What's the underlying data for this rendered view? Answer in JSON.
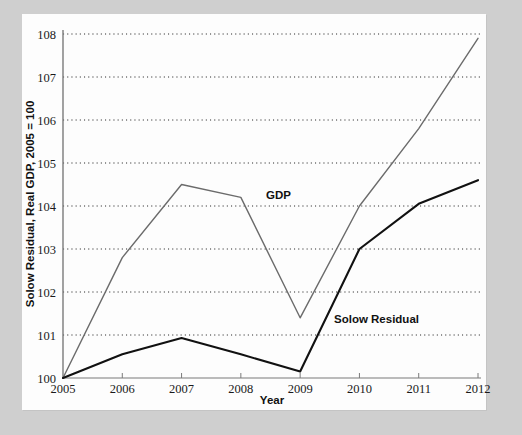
{
  "figure": {
    "background_color": "#cfcfcf",
    "panel_color": "#fdfdfd"
  },
  "chart_data": {
    "type": "line",
    "title": "",
    "xlabel": "Year",
    "ylabel": "Solow Residual, Real GDP, 2005 = 100",
    "x": [
      2005,
      2006,
      2007,
      2008,
      2009,
      2010,
      2011,
      2012
    ],
    "categories": [
      "2005",
      "2006",
      "2007",
      "2008",
      "2009",
      "2010",
      "2011",
      "2012"
    ],
    "xlim": [
      2005,
      2012
    ],
    "ylim": [
      100,
      108
    ],
    "yticks": [
      100,
      101,
      102,
      103,
      104,
      105,
      106,
      107,
      108
    ],
    "ytick_labels": [
      "100",
      "101",
      "102",
      "103",
      "104",
      "105",
      "106",
      "107",
      "108"
    ],
    "xticks": [
      2005,
      2006,
      2007,
      2008,
      2009,
      2010,
      2011,
      2012
    ],
    "grid": "horizontal-dotted",
    "legend_position": "inline-annotations",
    "series": [
      {
        "name": "GDP",
        "color": "#6b6b6b",
        "line_width": 1.4,
        "label_text": "GDP",
        "values": [
          100.0,
          102.8,
          104.5,
          104.2,
          101.4,
          104.0,
          105.8,
          107.9
        ]
      },
      {
        "name": "Solow Residual",
        "color": "#111111",
        "line_width": 2.1,
        "label_text": "Solow Residual",
        "values": [
          100.0,
          100.55,
          100.93,
          100.55,
          100.15,
          103.0,
          104.05,
          104.6
        ]
      }
    ],
    "annotations": [
      {
        "text": "GDP",
        "x_px": 266,
        "y_px": 199
      },
      {
        "text": "Solow Residual",
        "x_px": 334,
        "y_px": 323
      }
    ]
  },
  "axes": {
    "x_axis_title": "Year",
    "y_axis_title": "Solow Residual, Real GDP, 2005 = 100"
  }
}
